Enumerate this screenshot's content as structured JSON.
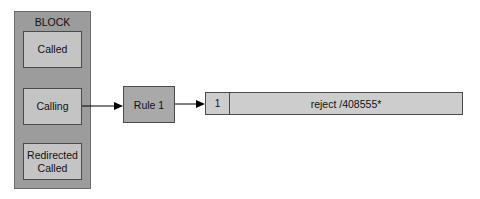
{
  "block": {
    "title": "BLOCK",
    "items": [
      {
        "label": "Called"
      },
      {
        "label": "Calling"
      },
      {
        "label": "Redirected Called"
      }
    ]
  },
  "rule": {
    "label": "Rule 1"
  },
  "rule_table": {
    "rows": [
      {
        "index": "1",
        "pattern": "reject /408555*"
      }
    ]
  },
  "colors": {
    "block_bg": "#9c9c9c",
    "inner_box_bg": "#c4c4c4",
    "rule_bg": "#a9a9a9",
    "table_bg": "#cdcdcd",
    "line": "#000000"
  }
}
